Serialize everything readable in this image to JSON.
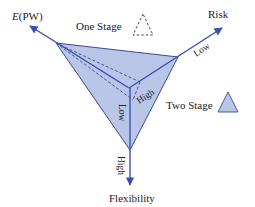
{
  "diagram": {
    "axes": {
      "epw": {
        "label_italic": "E",
        "label_rest": "(PW)"
      },
      "risk": {
        "label": "Risk",
        "direction_label": "Low"
      },
      "flexibility": {
        "label": "Flexibility",
        "direction_label": "High"
      },
      "inner_epw": {
        "direction_label": "Low"
      },
      "inner_risk": {
        "direction_label": "High"
      }
    },
    "legend": {
      "one_stage": {
        "label": "One Stage",
        "style": "dashed-triangle"
      },
      "two_stage": {
        "label": "Two Stage",
        "style": "filled-triangle"
      }
    },
    "colors": {
      "fill": "#b9c6e8",
      "axis": "#3a4fb0",
      "edge": "#3b4a8c",
      "dashed": "#3b4a8c"
    }
  }
}
